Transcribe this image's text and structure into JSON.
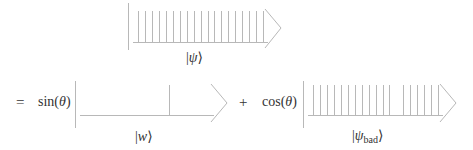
{
  "colors": {
    "stroke": "#b8b8b8",
    "text": "#333333",
    "background": "#ffffff"
  },
  "equation": {
    "equals": "=",
    "plus": "+",
    "sin_coeff": "sin(θ)",
    "cos_coeff": "cos(θ)"
  },
  "vectors": {
    "psi": {
      "label_open": "|",
      "label_symbol": "ψ",
      "label_close": "⟩",
      "label_sub": "",
      "ticks": 19,
      "missing_tick_index": null
    },
    "w": {
      "label_open": "|",
      "label_symbol": "w",
      "label_close": "⟩",
      "label_sub": "",
      "ticks": 1,
      "marked_tick_index": 12
    },
    "psi_bad": {
      "label_open": "|",
      "label_symbol": "ψ",
      "label_close": "⟩",
      "label_sub": "bad",
      "ticks": 18,
      "missing_tick_index": 12
    }
  }
}
